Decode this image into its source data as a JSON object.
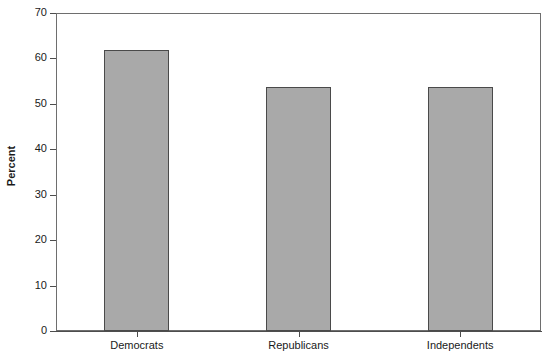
{
  "chart_data": {
    "type": "bar",
    "title": "",
    "subtitle": "",
    "xlabel": "",
    "ylabel": "Percent",
    "categories": [
      "Democrats",
      "Republicans",
      "Independents"
    ],
    "values": [
      61.8,
      53.8,
      53.8
    ],
    "ylim": [
      0,
      70
    ],
    "yticks": [
      0,
      10,
      20,
      30,
      40,
      50,
      60,
      70
    ],
    "ytick_labels": [
      "0",
      "10",
      "20",
      "30",
      "40",
      "50",
      "60",
      "70"
    ],
    "grid": false,
    "legend": null,
    "bar_color": "#a9a9a9",
    "bar_edge_color": "#4a4a4a",
    "background_color": "#ffffff",
    "axis_color": "#4d4d4d",
    "annotations": []
  }
}
